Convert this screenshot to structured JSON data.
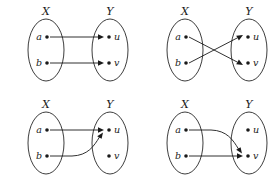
{
  "figure": {
    "background_color": "#ffffff",
    "stroke_color": "#1a1a1a",
    "panel_count": 4
  },
  "labels": {
    "set_x": "X",
    "set_y": "Y",
    "elem_a": "a",
    "elem_b": "b",
    "elem_u": "u",
    "elem_v": "v"
  },
  "panels": [
    {
      "id": "panel-top-left",
      "position": "top-left",
      "domain_label": "X",
      "codomain_label": "Y",
      "domain_elements": [
        "a",
        "b"
      ],
      "codomain_elements": [
        "u",
        "v"
      ],
      "mappings": [
        {
          "from": "a",
          "to": "u",
          "style": "straight"
        },
        {
          "from": "b",
          "to": "v",
          "style": "straight"
        }
      ]
    },
    {
      "id": "panel-top-right",
      "position": "top-right",
      "domain_label": "X",
      "codomain_label": "Y",
      "domain_elements": [
        "a",
        "b"
      ],
      "codomain_elements": [
        "u",
        "v"
      ],
      "mappings": [
        {
          "from": "a",
          "to": "v",
          "style": "straight"
        },
        {
          "from": "b",
          "to": "u",
          "style": "straight"
        }
      ]
    },
    {
      "id": "panel-bottom-left",
      "position": "bottom-left",
      "domain_label": "X",
      "codomain_label": "Y",
      "domain_elements": [
        "a",
        "b"
      ],
      "codomain_elements": [
        "u",
        "v"
      ],
      "mappings": [
        {
          "from": "a",
          "to": "u",
          "style": "straight"
        },
        {
          "from": "b",
          "to": "u",
          "style": "curved"
        }
      ]
    },
    {
      "id": "panel-bottom-right",
      "position": "bottom-right",
      "domain_label": "X",
      "codomain_label": "Y",
      "domain_elements": [
        "a",
        "b"
      ],
      "codomain_elements": [
        "u",
        "v"
      ],
      "mappings": [
        {
          "from": "a",
          "to": "v",
          "style": "curved"
        },
        {
          "from": "b",
          "to": "v",
          "style": "straight"
        }
      ]
    }
  ]
}
